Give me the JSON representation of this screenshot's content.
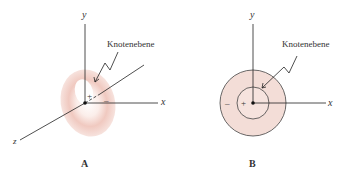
{
  "panel_a": {
    "label": "A",
    "axes": {
      "x": "x",
      "y": "y",
      "z": "z"
    },
    "annotation": "Knotenebene",
    "plus": "+",
    "minus": "–"
  },
  "panel_b": {
    "label": "B",
    "axes": {
      "x": "x",
      "y": "y"
    },
    "annotation": "Knotenebene",
    "plus": "+",
    "minus": "–"
  },
  "colors": {
    "lobe_fill": "#f3d9d2",
    "lobe_dark": "#e6b7ad",
    "axis": "#222222",
    "text": "#333333"
  }
}
